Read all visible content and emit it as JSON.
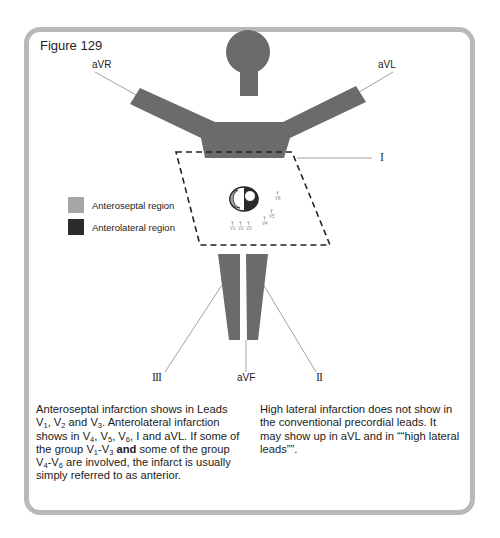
{
  "figure": {
    "title": "Figure 129"
  },
  "leads": {
    "aVR": "aVR",
    "aVL": "aVL",
    "I": "I",
    "II": "II",
    "III": "III",
    "aVF": "aVF"
  },
  "precordial_leads": [
    "V1",
    "V2",
    "V3",
    "V4",
    "V5",
    "V6"
  ],
  "legend": {
    "items": [
      {
        "label": "Anteroseptal region",
        "color": "#a6a6a6"
      },
      {
        "label": "Anterolateral region",
        "color": "#2b2b2b"
      }
    ]
  },
  "colors": {
    "body": "#6b6b6b",
    "frame": "#b9b9b9",
    "lead_line": "#8a8a8a"
  },
  "text": {
    "left_column": {
      "p1_a": "Anteroseptal infarction shows in Leads V",
      "p1_sub1": "1",
      "p1_b": ", V",
      "p1_sub2": "2",
      "p1_c": " and V",
      "p1_sub3": "3",
      "p1_d": ". Anterolateral infarction shows in V",
      "p1_sub4": "4",
      "p1_e": ", V",
      "p1_sub5": "5",
      "p1_f": ", V",
      "p1_sub6": "6",
      "p1_g": ", I and aVL. If some of the group V",
      "p1_sub7": "1",
      "p1_h": "-V",
      "p1_sub8": "3",
      "p1_bold": "and",
      "p1_i": " some of the group V",
      "p1_sub9": "4",
      "p1_j": "-V",
      "p1_sub10": "6",
      "p1_k": " are involved, the infarct is usually simply referred to as anterior."
    },
    "right_column": "High lateral infarction does not show in the conventional precordial leads. It may show up in aVL and in ““high lateral leads””."
  }
}
